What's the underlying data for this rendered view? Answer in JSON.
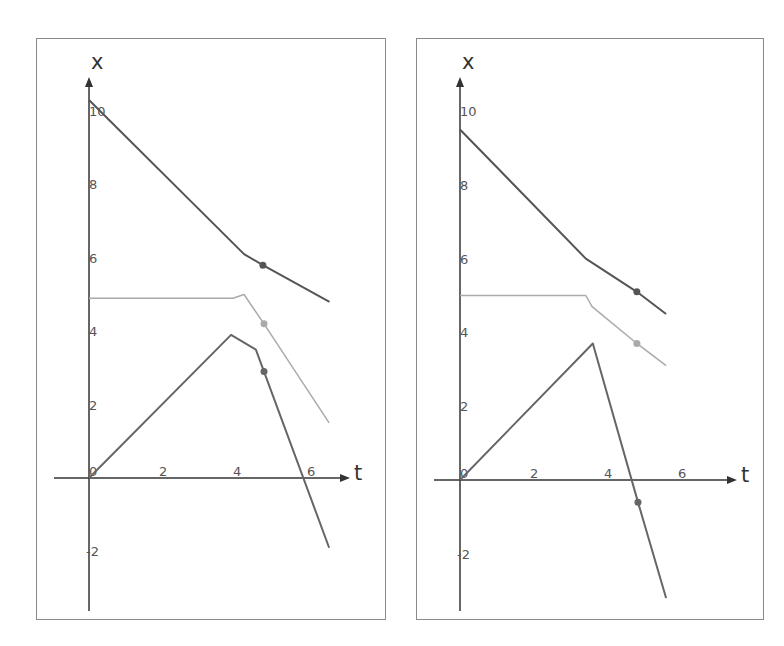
{
  "chart_data": [
    {
      "type": "line",
      "title": "",
      "xlabel": "t",
      "ylabel": "x",
      "xticks": [
        0,
        2,
        4,
        6
      ],
      "yticks": [
        -2,
        0,
        2,
        4,
        6,
        8,
        10
      ],
      "xlim": [
        -0.9,
        7.1
      ],
      "ylim": [
        -3.7,
        11.5
      ],
      "grid": false,
      "legend": null,
      "series": [
        {
          "name": "top",
          "color": "#555555",
          "points": [
            [
              0,
              10.3
            ],
            [
              4.19,
              6.1
            ],
            [
              4.7,
              5.8
            ],
            [
              6.5,
              4.8
            ]
          ],
          "marker": [
            4.7,
            5.8
          ]
        },
        {
          "name": "middle",
          "color": "#aaaaaa",
          "points": [
            [
              0,
              4.9
            ],
            [
              3.89,
              4.9
            ],
            [
              4.19,
              5.0
            ],
            [
              4.73,
              4.2
            ],
            [
              6.49,
              1.5
            ]
          ],
          "marker": [
            4.73,
            4.2
          ]
        },
        {
          "name": "bottom",
          "color": "#666666",
          "points": [
            [
              0,
              0
            ],
            [
              3.84,
              3.9
            ],
            [
              4.51,
              3.5
            ],
            [
              4.73,
              2.9
            ],
            [
              6.49,
              -1.9
            ]
          ],
          "marker": [
            4.73,
            2.9
          ]
        }
      ]
    },
    {
      "type": "line",
      "title": "",
      "xlabel": "t",
      "ylabel": "x",
      "xticks": [
        0,
        2,
        4,
        6
      ],
      "yticks": [
        -2,
        0,
        2,
        4,
        6,
        8,
        10
      ],
      "xlim": [
        -0.9,
        7.1
      ],
      "ylim": [
        -3.7,
        11.5
      ],
      "grid": false,
      "legend": null,
      "series": [
        {
          "name": "top",
          "color": "#555555",
          "points": [
            [
              0,
              9.5
            ],
            [
              3.4,
              6.0
            ],
            [
              4.78,
              5.1
            ],
            [
              5.57,
              4.5
            ]
          ],
          "marker": [
            4.78,
            5.1
          ]
        },
        {
          "name": "middle",
          "color": "#aaaaaa",
          "points": [
            [
              0,
              5.0
            ],
            [
              3.4,
              5.0
            ],
            [
              3.57,
              4.7
            ],
            [
              4.78,
              3.7
            ],
            [
              5.57,
              3.1
            ]
          ],
          "marker": [
            4.78,
            3.7
          ]
        },
        {
          "name": "bottom",
          "color": "#666666",
          "points": [
            [
              0,
              0
            ],
            [
              3.59,
              3.7
            ],
            [
              4.81,
              -0.6
            ],
            [
              5.57,
              -3.2
            ]
          ],
          "marker": [
            4.81,
            -0.6
          ]
        }
      ]
    }
  ],
  "axes": {
    "x_label": "t",
    "y_label": "x"
  }
}
